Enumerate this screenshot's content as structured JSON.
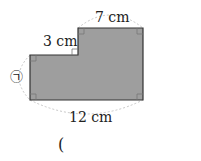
{
  "figure": {
    "labels": {
      "top": "7 cm",
      "step": "3 cm",
      "bottom": "12 cm",
      "unknown": "㉠"
    },
    "answer_paren": "(",
    "colors": {
      "fill": "#9e9e9e",
      "stroke": "#333333",
      "arc": "#c8c8c8"
    }
  }
}
